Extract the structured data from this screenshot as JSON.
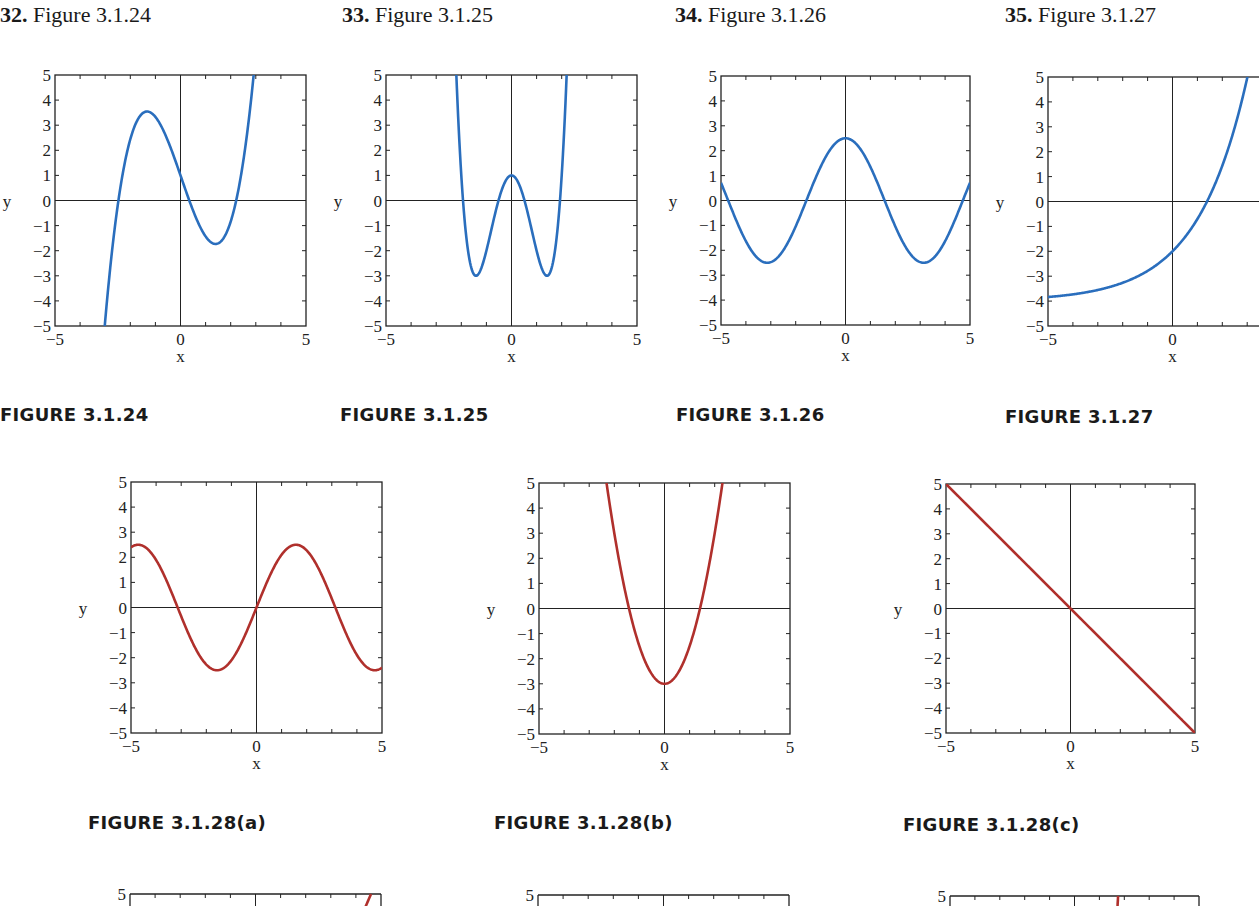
{
  "problems": [
    {
      "num": "32.",
      "label": "Figure 3.1.24"
    },
    {
      "num": "33.",
      "label": "Figure 3.1.25"
    },
    {
      "num": "34.",
      "label": "Figure 3.1.26"
    },
    {
      "num": "35.",
      "label": "Figure 3.1.27"
    }
  ],
  "captions": [
    "FIGURE 3.1.24",
    "FIGURE 3.1.25",
    "FIGURE 3.1.26",
    "FIGURE 3.1.27",
    "FIGURE 3.1.28(a)",
    "FIGURE 3.1.28(b)",
    "FIGURE 3.1.28(c)"
  ],
  "colors": {
    "blue": "#2a6ebd",
    "red": "#b0302c",
    "axis": "#222222"
  },
  "chart_data": [
    {
      "id": "fig-3-1-24",
      "type": "line",
      "title": "FIGURE 3.1.24",
      "xlabel": "x",
      "ylabel": "y",
      "xlim": [
        -5,
        5
      ],
      "ylim": [
        -5,
        5
      ],
      "xticks": [
        "-5",
        "0",
        "5"
      ],
      "yticks": [
        "5",
        "4",
        "3",
        "2",
        "1",
        "0",
        "-1",
        "-2",
        "-3",
        "-4",
        "-5"
      ],
      "color": "blue",
      "series": [
        {
          "name": "cubic",
          "x": [
            -2.9,
            -2.4,
            -2.0,
            -1.4,
            -1.0,
            -0.5,
            0,
            0.4,
            1.0,
            1.4,
            2.0,
            2.2,
            2.6,
            3.0
          ],
          "y": [
            -5.0,
            0.0,
            2.8,
            3.8,
            3.5,
            2.3,
            1.0,
            0.0,
            -1.5,
            -1.8,
            -0.9,
            0.0,
            2.4,
            5.0
          ]
        }
      ]
    },
    {
      "id": "fig-3-1-25",
      "type": "line",
      "title": "FIGURE 3.1.25",
      "xlabel": "x",
      "ylabel": "y",
      "xlim": [
        -5,
        5
      ],
      "ylim": [
        -5,
        5
      ],
      "xticks": [
        "-5",
        "0",
        "5"
      ],
      "yticks": [
        "5",
        "4",
        "3",
        "2",
        "1",
        "0",
        "-1",
        "-2",
        "-3",
        "-4",
        "-5"
      ],
      "color": "blue",
      "series": [
        {
          "name": "quartic",
          "x": [
            -2.2,
            -1.9,
            -1.4,
            -1.0,
            -0.5,
            0,
            0.5,
            1.0,
            1.4,
            1.9,
            2.2
          ],
          "y": [
            5.0,
            0.0,
            -3.0,
            -2.0,
            0.0,
            1.0,
            0.0,
            -2.0,
            -3.0,
            0.0,
            5.0
          ]
        }
      ]
    },
    {
      "id": "fig-3-1-26",
      "type": "line",
      "title": "FIGURE 3.1.26",
      "xlabel": "x",
      "ylabel": "y",
      "xlim": [
        -5,
        5
      ],
      "ylim": [
        -5,
        5
      ],
      "xticks": [
        "-5",
        "0",
        "5"
      ],
      "yticks": [
        "5",
        "4",
        "3",
        "2",
        "1",
        "0",
        "-1",
        "-2",
        "-3",
        "-4",
        "-5"
      ],
      "color": "blue",
      "series": [
        {
          "name": "cosine",
          "formula": "2.5*cos(x)",
          "x": [
            -5,
            -4.7,
            -3.14,
            -1.57,
            0,
            1.57,
            3.14,
            4.7,
            5
          ],
          "y": [
            0.7,
            0.0,
            -2.5,
            0.0,
            2.5,
            0.0,
            -2.5,
            0.0,
            0.7
          ]
        }
      ]
    },
    {
      "id": "fig-3-1-27",
      "type": "line",
      "title": "FIGURE 3.1.27",
      "xlabel": "x",
      "ylabel": "y",
      "xlim": [
        -5,
        5
      ],
      "ylim": [
        -5,
        5
      ],
      "xticks": [
        "-5",
        "0",
        "5"
      ],
      "yticks": [
        "5",
        "4",
        "3",
        "2",
        "1",
        "0",
        "-1",
        "-2",
        "-3",
        "-4",
        "-5"
      ],
      "color": "blue",
      "series": [
        {
          "name": "exponential",
          "formula": "2*exp(x/2)-4",
          "x": [
            -5,
            -3,
            -2,
            -1,
            0,
            1,
            1.4,
            2,
            3,
            3.5
          ],
          "y": [
            -3.7,
            -3.5,
            -3.3,
            -2.8,
            -2.0,
            -0.7,
            0.0,
            1.4,
            5.0,
            7.5
          ]
        }
      ]
    },
    {
      "id": "fig-3-1-28a",
      "type": "line",
      "title": "FIGURE 3.1.28(a)",
      "xlabel": "x",
      "ylabel": "y",
      "xlim": [
        -5,
        5
      ],
      "ylim": [
        -5,
        5
      ],
      "xticks": [
        "-5",
        "0",
        "5"
      ],
      "yticks": [
        "5",
        "4",
        "3",
        "2",
        "1",
        "0",
        "-1",
        "-2",
        "-3",
        "-4",
        "-5"
      ],
      "color": "red",
      "series": [
        {
          "name": "sine",
          "formula": "2.5*sin(x)",
          "x": [
            -5,
            -4.7,
            -3.14,
            -1.57,
            0,
            1.57,
            3.14,
            4.7,
            5
          ],
          "y": [
            2.4,
            2.5,
            0.0,
            -2.5,
            0.0,
            2.5,
            0.0,
            -2.5,
            -2.4
          ]
        }
      ]
    },
    {
      "id": "fig-3-1-28b",
      "type": "line",
      "title": "FIGURE 3.1.28(b)",
      "xlabel": "x",
      "ylabel": "y",
      "xlim": [
        -5,
        5
      ],
      "ylim": [
        -5,
        5
      ],
      "xticks": [
        "-5",
        "0",
        "5"
      ],
      "yticks": [
        "5",
        "4",
        "3",
        "2",
        "1",
        "0",
        "-1",
        "-2",
        "-3",
        "-4",
        "-5"
      ],
      "color": "red",
      "series": [
        {
          "name": "parabola",
          "formula": "1.5*x^2-3",
          "x": [
            -2.3,
            -1.41,
            -1,
            0,
            1,
            1.41,
            2.3
          ],
          "y": [
            5.0,
            0.0,
            -1.5,
            -3.0,
            -1.5,
            0.0,
            5.0
          ]
        }
      ]
    },
    {
      "id": "fig-3-1-28c",
      "type": "line",
      "title": "FIGURE 3.1.28(c)",
      "xlabel": "x",
      "ylabel": "y",
      "xlim": [
        -5,
        5
      ],
      "ylim": [
        -5,
        5
      ],
      "xticks": [
        "-5",
        "0",
        "5"
      ],
      "yticks": [
        "5",
        "4",
        "3",
        "2",
        "1",
        "0",
        "-1",
        "-2",
        "-3",
        "-4",
        "-5"
      ],
      "color": "red",
      "series": [
        {
          "name": "line",
          "formula": "-x",
          "x": [
            -5,
            0,
            5
          ],
          "y": [
            5,
            0,
            -5
          ]
        }
      ]
    },
    {
      "id": "partial-row-a",
      "type": "line",
      "yticks": [
        "5"
      ],
      "color": "red",
      "partial": true
    },
    {
      "id": "partial-row-b",
      "type": "line",
      "yticks": [
        "5"
      ],
      "color": "red",
      "partial": true
    },
    {
      "id": "partial-row-c",
      "type": "line",
      "yticks": [
        "5"
      ],
      "color": "red",
      "partial": true
    }
  ]
}
